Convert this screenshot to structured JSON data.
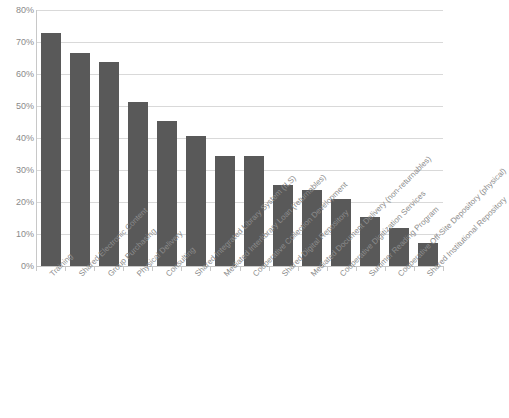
{
  "chart_data": {
    "type": "bar",
    "title": "",
    "subtitle": "",
    "xlabel": "",
    "ylabel": "",
    "ylim": [
      0,
      80
    ],
    "yunit": "%",
    "grid": true,
    "legend": false,
    "legend_position": "none",
    "orientation": "vertical",
    "bar_color": "#595959",
    "gridline_color": "#d9d9d9",
    "axis_color": "#c8c8c8",
    "tick_label_color": "#8a8a8a",
    "category_label_rotation": -45,
    "y_ticks": [
      "0%",
      "10%",
      "20%",
      "30%",
      "40%",
      "50%",
      "60%",
      "70%",
      "80%"
    ],
    "y_tick_values": [
      0,
      10,
      20,
      30,
      40,
      50,
      60,
      70,
      80
    ],
    "categories": [
      "Training",
      "Shared Electronic Content",
      "Group Purchasing",
      "Physical Delivery",
      "Consulting",
      "Shared Integrated Library System (ILS)",
      "Mediated Interlibrary Loan (returnables)",
      "Cooperative Collection Development",
      "Shared Digital Repository",
      "Mediated Document Delivery (non-returnables)",
      "Cooperative Digitization Services",
      "Summer Reading Program",
      "Cooperative Off-Site Depository (physical)",
      "Shared Institutional Repository"
    ],
    "values": [
      72.7,
      66.6,
      63.8,
      51.3,
      45.3,
      40.6,
      34.4,
      34.4,
      25.3,
      23.6,
      20.9,
      15.2,
      11.8,
      7.3
    ]
  }
}
